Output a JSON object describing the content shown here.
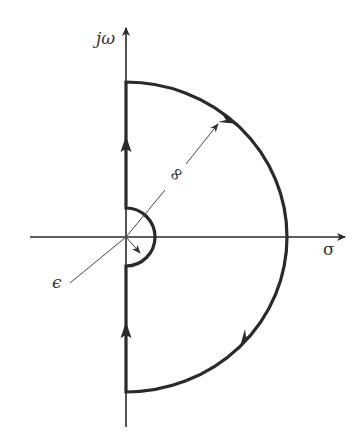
{
  "diagram": {
    "type": "nyquist-contour",
    "axes": {
      "vertical_label": "jω",
      "horizontal_label": "σ"
    },
    "annotations": {
      "large_radius_label": "∞",
      "small_radius_label": "ϵ"
    },
    "colors": {
      "stroke": "#2a2a2a",
      "thin": "#444444",
      "background": "#ffffff"
    }
  }
}
